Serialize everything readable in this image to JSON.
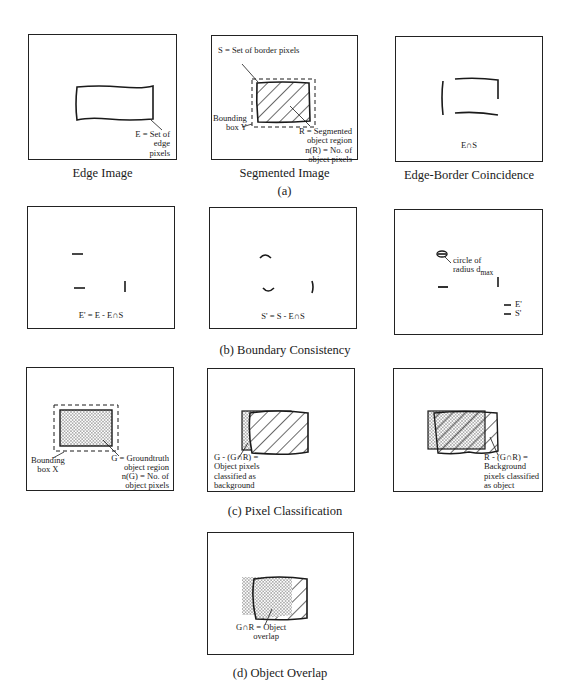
{
  "figure": {
    "row_a": {
      "group_caption": "(a)",
      "panels": [
        {
          "caption": "Edge Image",
          "labels": {
            "edge": "E = Set of\nedge\npixels"
          }
        },
        {
          "caption": "Segmented Image",
          "labels": {
            "border": "S = Set of border pixels",
            "bbox": "Bounding\nbox Y",
            "region": "R = Segmented\nobject region",
            "count": "n(R) = No. of\nobject pixels"
          }
        },
        {
          "caption": "Edge-Border Coincidence",
          "labels": {
            "formula": "E∩S"
          }
        }
      ]
    },
    "row_b": {
      "group_caption": "(b) Boundary Consistency",
      "panels": [
        {
          "labels": {
            "formula": "E' = E - E∩S"
          }
        },
        {
          "labels": {
            "formula": "S' = S - E∩S"
          }
        },
        {
          "labels": {
            "circle": "circle of\nradius d",
            "subscript": "max",
            "legend_e": "E'",
            "legend_s": "S'"
          }
        }
      ]
    },
    "row_c": {
      "group_caption": "(c) Pixel Classification",
      "panels": [
        {
          "labels": {
            "bbox": "Bounding\nbox X",
            "region": "G = Groundtruth\nobject region",
            "count": "n(G) = No. of\nobject pixels"
          }
        },
        {
          "labels": {
            "formula": "G - (G∩R) =\nObject pixels\nclassified as\nbackground"
          }
        },
        {
          "labels": {
            "formula": "R - (G∩R) =\nBackground\npixels classified\nas object"
          }
        }
      ]
    },
    "row_d": {
      "group_caption": "(d) Object Overlap",
      "panels": [
        {
          "labels": {
            "formula": "G∩R = Object\n        overlap"
          }
        }
      ]
    }
  },
  "colors": {
    "ink": "#1a1a1a",
    "background": "#ffffff"
  }
}
